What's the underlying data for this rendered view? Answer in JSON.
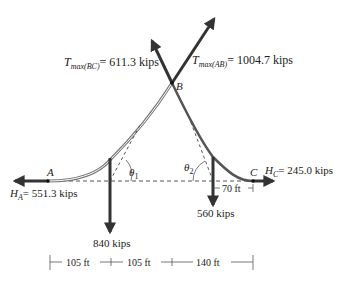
{
  "diagram": {
    "type": "cable-force-diagram",
    "points": {
      "A": "A",
      "B": "B",
      "C": "C"
    },
    "forces": {
      "T_BC": {
        "symbol": "T",
        "subscript": "max(BC)",
        "value": "= 611.3 kips"
      },
      "T_AB": {
        "symbol": "T",
        "subscript": "max(AB)",
        "value": "= 1004.7 kips"
      },
      "H_A": {
        "symbol": "H",
        "subscript": "A",
        "value": "= 551.3 kips"
      },
      "H_C": {
        "symbol": "H",
        "subscript": "C",
        "value": "= 245.0 kips"
      },
      "load_1": "840 kips",
      "load_2": "560 kips"
    },
    "angles": {
      "theta1": {
        "symbol": "θ",
        "sub": "1"
      },
      "theta2": {
        "symbol": "θ",
        "sub": "2"
      }
    },
    "dimensions": {
      "span_1": "105 ft",
      "span_2": "105 ft",
      "span_3": "140 ft",
      "offset_C": "70 ft"
    },
    "colors": {
      "cable": "#555555",
      "arrow": "#333333",
      "dashed": "#555555",
      "text": "#222222"
    }
  }
}
